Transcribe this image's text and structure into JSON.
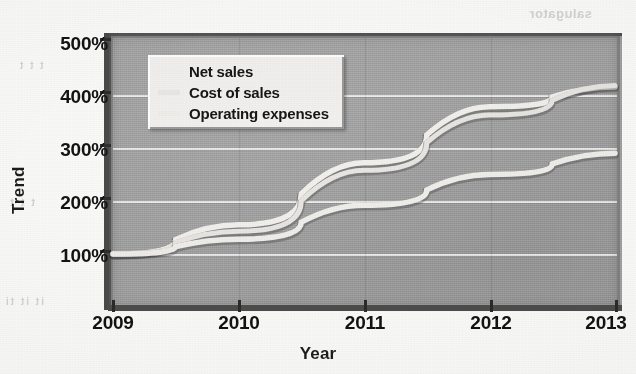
{
  "chart_data": {
    "type": "line",
    "title": "",
    "xlabel": "Year",
    "ylabel": "Trend",
    "x": [
      2009,
      2010,
      2011,
      2012,
      2013
    ],
    "xtick_labels": [
      "2009",
      "2010",
      "2011",
      "2012",
      "2013"
    ],
    "ytick_labels": [
      "100%",
      "200%",
      "300%",
      "400%",
      "500%"
    ],
    "ytick_values": [
      100,
      200,
      300,
      400,
      500
    ],
    "ylim": [
      50,
      500
    ],
    "xlim": [
      2009,
      2013
    ],
    "grid": "horizontal",
    "legend_position": "upper-left-inside",
    "series": [
      {
        "name": "Net sales",
        "color": "#f2f0ec",
        "values": [
          100,
          155,
          272,
          378,
          415
        ]
      },
      {
        "name": "Cost of sales",
        "color": "#e8e6e2",
        "values": [
          100,
          143,
          258,
          362,
          418
        ]
      },
      {
        "name": "Operating expenses",
        "color": "#efeeea",
        "values": [
          100,
          128,
          192,
          250,
          290
        ]
      }
    ]
  },
  "axes": {
    "y_title": "Trend",
    "x_title": "Year",
    "y_ticks": [
      {
        "label": "500%",
        "value": 500
      },
      {
        "label": "400%",
        "value": 400
      },
      {
        "label": "300%",
        "value": 300
      },
      {
        "label": "200%",
        "value": 200
      },
      {
        "label": "100%",
        "value": 100
      }
    ],
    "x_ticks": [
      {
        "label": "2009"
      },
      {
        "label": "2010"
      },
      {
        "label": "2011"
      },
      {
        "label": "2012"
      },
      {
        "label": "2013"
      }
    ]
  },
  "legend": {
    "items": [
      {
        "label": "Net sales",
        "color": "#f2f0ec"
      },
      {
        "label": "Cost of sales",
        "color": "#e8e6e2"
      },
      {
        "label": "Operating expenses",
        "color": "#efeeea"
      }
    ]
  },
  "style": {
    "plot_background": "#a2a2a2",
    "gridline_color": "#ffffff",
    "frame_shadow_color": "#5f5f5f",
    "frame_highlight_color": "#b6b6b6",
    "legend_background": "#f2f1ef",
    "text_color": "#131313"
  },
  "artifacts": {
    "bleed_top_right": "salugator",
    "bleed_left_mid": "t  t  t",
    "bleed_left_low": "it  it  ti",
    "bleed_left_high": "t t t"
  }
}
